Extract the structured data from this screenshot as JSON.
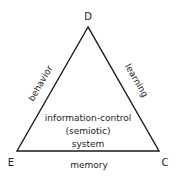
{
  "diagram": {
    "type": "triangle",
    "vertices": {
      "top": {
        "label": "D",
        "x": 88,
        "y": 27
      },
      "bottom_left": {
        "label": "E",
        "x": 17,
        "y": 151
      },
      "bottom_right": {
        "label": "C",
        "x": 159,
        "y": 151
      }
    },
    "edges": {
      "left": {
        "label": "behavior",
        "from": "E",
        "to": "D"
      },
      "right": {
        "label": "learning",
        "from": "D",
        "to": "C"
      },
      "bottom": {
        "label": "memory",
        "from": "E",
        "to": "C"
      }
    },
    "center": {
      "lines": [
        "information-control",
        "(semiotic)",
        "system"
      ]
    },
    "colors": {
      "stroke": "#1a1a1a",
      "text": "#222222",
      "background": "#ffffff"
    }
  }
}
